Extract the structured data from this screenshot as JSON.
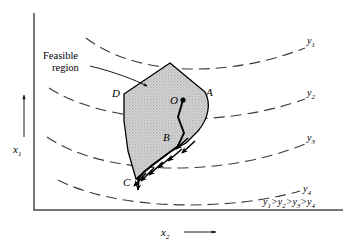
{
  "figure": {
    "background_color": "#ffffff",
    "ink_color": "#000000",
    "region_fill_color": "#c9c9c9",
    "region_edge_color": "#000000",
    "contour_color": "#3a3a3a"
  },
  "axes": {
    "x_axis": {
      "label_base": "x",
      "label_sub": "2",
      "arrow": "arrow-right",
      "orientation": "horizontal"
    },
    "y_axis": {
      "label_base": "x",
      "label_sub": "1",
      "arrow": "arrow-up",
      "orientation": "vertical"
    }
  },
  "annotations": {
    "feasible_region_line1": "Feasible",
    "feasible_region_line2": "region",
    "inequality": {
      "terms": [
        "y",
        "y",
        "y",
        "y"
      ],
      "subs": [
        "1",
        "2",
        "3",
        "4"
      ],
      "operator": ">",
      "full_text": "y1 > y2 > y3 > y4"
    }
  },
  "contours": [
    {
      "id": "y1",
      "label_base": "y",
      "label_sub": "1",
      "label_x": 312,
      "label_y": 44
    },
    {
      "id": "y2",
      "label_base": "y",
      "label_sub": "2",
      "label_x": 312,
      "label_y": 96
    },
    {
      "id": "y3",
      "label_base": "y",
      "label_sub": "3",
      "label_x": 312,
      "label_y": 141
    },
    {
      "id": "y4",
      "label_base": "y",
      "label_sub": "4",
      "label_x": 312,
      "label_y": 192
    }
  ],
  "vertices": [
    {
      "id": "A",
      "label": "A",
      "label_x": 209,
      "label_y": 95
    },
    {
      "id": "B",
      "label": "B",
      "label_x": 165,
      "label_y": 140
    },
    {
      "id": "C",
      "label": "C",
      "label_x": 126,
      "label_y": 184
    },
    {
      "id": "D",
      "label": "D",
      "label_x": 115,
      "label_y": 96
    },
    {
      "id": "O",
      "label": "O",
      "label_x": 172,
      "label_y": 103
    }
  ],
  "search_path": {
    "start_point": "O",
    "waypoint": "B",
    "end_point": "C",
    "marker": "arrowheads",
    "description": "zigzag descent path from O through B to C"
  }
}
